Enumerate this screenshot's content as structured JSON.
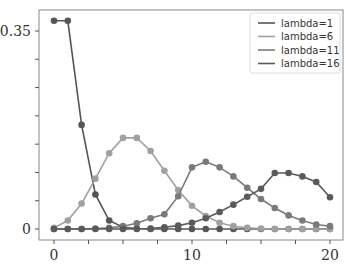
{
  "chart_data": {
    "type": "line",
    "title": "",
    "xlabel": "",
    "ylabel": "",
    "xlim": [
      -1.1,
      21.0
    ],
    "ylim": [
      -0.02,
      0.385
    ],
    "x": [
      0,
      1,
      2,
      3,
      4,
      5,
      6,
      7,
      8,
      9,
      10,
      11,
      12,
      13,
      14,
      15,
      16,
      17,
      18,
      19,
      20
    ],
    "x_ticks": [
      0,
      10,
      20
    ],
    "x_tick_labels": [
      "0",
      "10",
      "20"
    ],
    "x_minor_ticks": [
      0,
      2.5,
      5,
      7.5,
      10,
      12.5,
      15,
      17.5,
      20
    ],
    "y_ticks": [
      0,
      0.05,
      0.1,
      0.15,
      0.2,
      0.25,
      0.3,
      0.35
    ],
    "y_tick_labels": {
      "0": "0",
      "0.35": "0.35"
    },
    "grid": false,
    "legend_position": "upper right",
    "series": [
      {
        "name": "lambda=1",
        "color": "#555555",
        "values": [
          0.368,
          0.368,
          0.184,
          0.061,
          0.015,
          0.003,
          0.001,
          0,
          0,
          0,
          0,
          0,
          0,
          0,
          0,
          0,
          0,
          0,
          0,
          0,
          0
        ]
      },
      {
        "name": "lambda=6",
        "color": "#a0a0a0",
        "values": [
          0.002,
          0.015,
          0.045,
          0.089,
          0.134,
          0.161,
          0.161,
          0.138,
          0.103,
          0.069,
          0.041,
          0.023,
          0.011,
          0.005,
          0.002,
          0.001,
          0,
          0,
          0,
          0,
          0
        ]
      },
      {
        "name": "lambda=11",
        "color": "#7a7a7a",
        "values": [
          0,
          0,
          0,
          0.001,
          0.002,
          0.005,
          0.01,
          0.019,
          0.026,
          0.058,
          0.109,
          0.119,
          0.109,
          0.093,
          0.073,
          0.053,
          0.037,
          0.024,
          0.015,
          0.008,
          0.005
        ]
      },
      {
        "name": "lambda=16",
        "color": "#5a5a5a",
        "values": [
          0,
          0,
          0,
          0,
          0,
          0,
          0,
          0.001,
          0.003,
          0.006,
          0.011,
          0.019,
          0.03,
          0.043,
          0.057,
          0.071,
          0.099,
          0.099,
          0.093,
          0.083,
          0.056
        ]
      }
    ]
  }
}
